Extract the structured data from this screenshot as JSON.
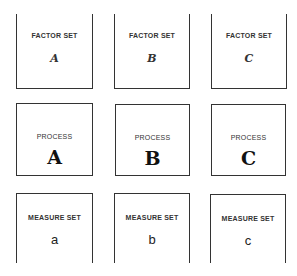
{
  "rows": {
    "factor_sets": [
      {
        "label": "FACTOR SET",
        "id": "A"
      },
      {
        "label": "FACTOR SET",
        "id": "B"
      },
      {
        "label": "FACTOR SET",
        "id": "C"
      }
    ],
    "processes": [
      {
        "label": "PROCESS",
        "id": "A"
      },
      {
        "label": "PROCESS",
        "id": "B"
      },
      {
        "label": "PROCESS",
        "id": "C"
      }
    ],
    "measure_sets": [
      {
        "label": "MEASURE SET",
        "id": "a"
      },
      {
        "label": "MEASURE SET",
        "id": "b"
      },
      {
        "label": "MEASURE SET",
        "id": "c"
      }
    ]
  }
}
